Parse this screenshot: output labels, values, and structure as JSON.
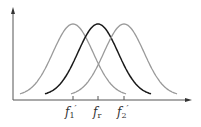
{
  "figure": {
    "curves": [
      {
        "name": "left-curve",
        "center_label": "f1'",
        "color": "#9a9a9a"
      },
      {
        "name": "center-curve",
        "center_label": "fr",
        "color": "#1a1a1a"
      },
      {
        "name": "right-curve",
        "center_label": "f2'",
        "color": "#9a9a9a"
      }
    ],
    "axis_color": "#555555",
    "tick_labels": [
      {
        "base": "f",
        "sub": "1",
        "prime": "′"
      },
      {
        "base": "f",
        "sub": "r",
        "prime": ""
      },
      {
        "base": "f",
        "sub": "2",
        "prime": "′"
      }
    ]
  }
}
